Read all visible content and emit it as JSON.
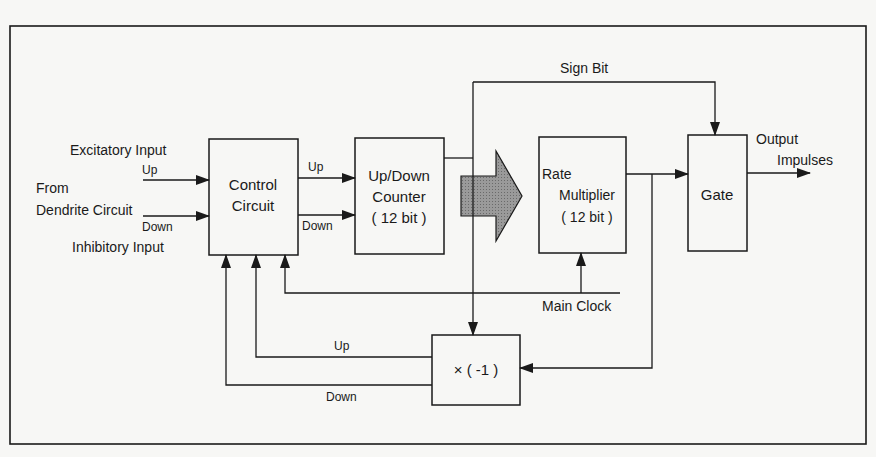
{
  "diagram": {
    "type": "block-diagram",
    "blocks": {
      "control_circuit": {
        "line1": "Control",
        "line2": "Circuit"
      },
      "counter": {
        "line1": "Up/Down",
        "line2": "Counter",
        "line3": "( 12 bit )"
      },
      "rate_multiplier": {
        "line1": "Rate",
        "line2": "Multiplier",
        "line3": "( 12 bit )"
      },
      "gate": {
        "label": "Gate"
      },
      "negate": {
        "label": "× ( -1 )"
      }
    },
    "labels": {
      "excitatory_input": "Excitatory Input",
      "from": "From",
      "dendrite_circuit": "Dendrite Circuit",
      "inhibitory_input": "Inhibitory Input",
      "in_up": "Up",
      "in_down": "Down",
      "cc_up": "Up",
      "cc_down": "Down",
      "sign_bit": "Sign Bit",
      "output": "Output",
      "impulses": "Impulses",
      "main_clock": "Main Clock",
      "fb_up": "Up",
      "fb_down": "Down"
    },
    "colors": {
      "line": "#1a1a1a",
      "background": "#f7f7f5",
      "arrow_fill": "#8a8a8a"
    }
  }
}
